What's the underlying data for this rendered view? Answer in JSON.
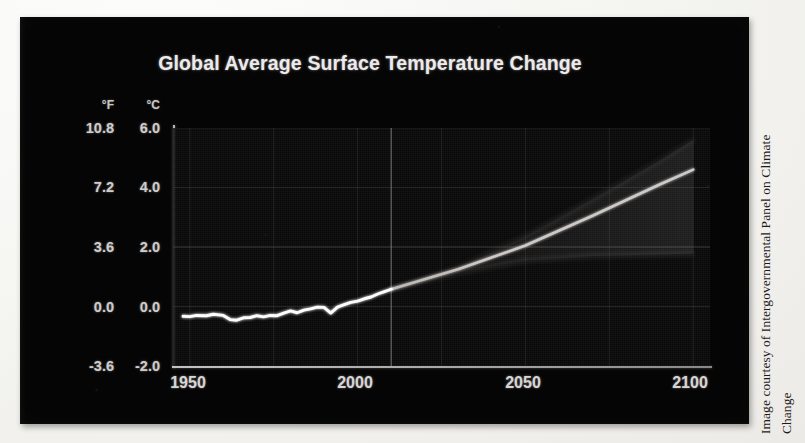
{
  "figure": {
    "title": "Global Average Surface Temperature Change",
    "credit_line_1": "Image courtesy of Intergovernmental Panel on Climate",
    "credit_line_2": "Change",
    "panel_background": "#050505",
    "line_color": "#ffffff",
    "grid_color": "#4a4745",
    "text_color": "#d4d1d0",
    "paper_color": "#f4f4f1"
  },
  "axes": {
    "unit_fahrenheit_header": "°F",
    "unit_celsius_header": "°C",
    "y_ticks_fahrenheit": [
      "10.8",
      "7.2",
      "3.6",
      "0.0",
      "-3.6"
    ],
    "y_ticks_celsius": [
      "6.0",
      "4.0",
      "2.0",
      "0.0",
      "-2.0"
    ],
    "x_ticks": [
      "1950",
      "2000",
      "2050",
      "2100"
    ]
  },
  "chart_data": {
    "type": "line",
    "title": "Global Average Surface Temperature Change",
    "xlabel": "",
    "ylabel": "Temperature change",
    "ylabel_secondary": "°F",
    "y_unit_primary": "°C",
    "y_unit_secondary": "°F",
    "xlim": [
      1945,
      2105
    ],
    "ylim": [
      -2.0,
      6.0
    ],
    "yticks": [
      -2.0,
      0.0,
      2.0,
      4.0,
      6.0
    ],
    "yticks_fahrenheit": [
      -3.6,
      0.0,
      3.6,
      7.2,
      10.8
    ],
    "xticks": [
      1950,
      2000,
      2050,
      2100
    ],
    "grid": true,
    "legend": "none",
    "observation_projection_split_year": 2010,
    "series": [
      {
        "name": "Observed global average surface temperature",
        "kind": "observed",
        "color": "#ffffff",
        "x": [
          1948,
          1950,
          1952,
          1955,
          1957,
          1960,
          1962,
          1964,
          1966,
          1968,
          1970,
          1972,
          1974,
          1976,
          1978,
          1980,
          1982,
          1984,
          1986,
          1988,
          1990,
          1992,
          1994,
          1996,
          1998,
          2000,
          2002,
          2004,
          2006,
          2008,
          2010
        ],
        "values": [
          -0.33,
          -0.34,
          -0.3,
          -0.31,
          -0.26,
          -0.3,
          -0.44,
          -0.46,
          -0.38,
          -0.37,
          -0.31,
          -0.35,
          -0.3,
          -0.31,
          -0.22,
          -0.15,
          -0.21,
          -0.12,
          -0.08,
          -0.02,
          -0.03,
          -0.22,
          -0.02,
          0.06,
          0.14,
          0.18,
          0.26,
          0.32,
          0.42,
          0.5,
          0.58
        ]
      },
      {
        "name": "High emissions scenario (upper envelope)",
        "kind": "projection",
        "color": "#5a5754",
        "x": [
          2010,
          2030,
          2050,
          2070,
          2090,
          2100
        ],
        "values": [
          0.58,
          1.3,
          2.35,
          3.6,
          4.9,
          5.6
        ]
      },
      {
        "name": "Mid emissions scenario (central projection)",
        "kind": "projection",
        "color": "#d6d3d1",
        "x": [
          2010,
          2030,
          2050,
          2070,
          2090,
          2100
        ],
        "values": [
          0.58,
          1.25,
          2.05,
          3.05,
          4.1,
          4.6
        ]
      },
      {
        "name": "Low emissions scenario (lower envelope)",
        "kind": "projection",
        "color": "#6e6b68",
        "x": [
          2010,
          2030,
          2050,
          2070,
          2090,
          2100
        ],
        "values": [
          0.58,
          1.15,
          1.55,
          1.7,
          1.75,
          1.78
        ]
      }
    ],
    "annotations": []
  }
}
